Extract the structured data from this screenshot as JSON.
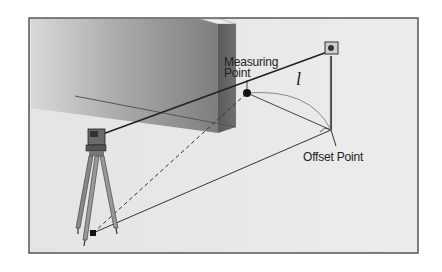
{
  "diagram": {
    "type": "surveying-offset-measurement",
    "labels": {
      "measuring_point": "Measuring\nPoint",
      "measuring_point_line1": "Measuring",
      "measuring_point_line2": "Point",
      "offset_point": "Offset Point",
      "distance_symbol": "l"
    },
    "elements": [
      {
        "name": "total-station-on-tripod",
        "description": "Surveying instrument on tripod, lower left"
      },
      {
        "name": "wall",
        "description": "Gray wall block, center-left"
      },
      {
        "name": "measuring-point",
        "description": "Black dot on wall edge"
      },
      {
        "name": "prism-pole",
        "description": "Reflector prism on pole, right"
      },
      {
        "name": "offset-point",
        "description": "Base of prism pole with right-angle marker"
      }
    ],
    "colors": {
      "frame_bg": "#e8e8e8",
      "frame_border": "#555555",
      "wall_face": "#8a8a8a",
      "wall_side": "#5a5a5a",
      "line": "#222222"
    }
  }
}
